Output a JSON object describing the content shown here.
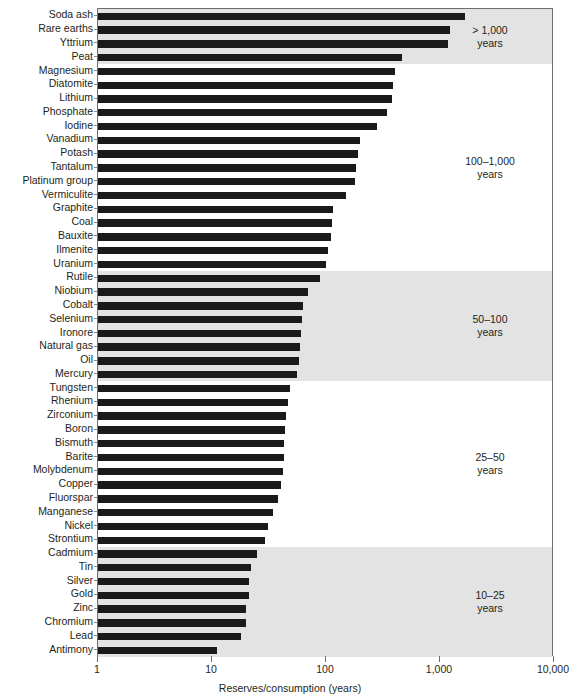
{
  "chart_data": {
    "type": "bar",
    "orientation": "horizontal",
    "title": "",
    "xlabel": "Reserves/consumption (years)",
    "ylabel": "",
    "xscale": "log",
    "xlim": [
      1,
      10000
    ],
    "xticks": [
      1,
      10,
      100,
      1000,
      10000
    ],
    "xtick_labels": [
      "1",
      "10",
      "100",
      "1,000",
      "10,000"
    ],
    "grid": false,
    "legend": false,
    "bar_color": "#1a1a1a",
    "band_shade_color": "#e3e3e3",
    "categories": [
      "Soda ash",
      "Rare earths",
      "Yttrium",
      "Peat",
      "Magnesium",
      "Diatomite",
      "Lithium",
      "Phosphate",
      "Iodine",
      "Vanadium",
      "Potash",
      "Tantalum",
      "Platinum group",
      "Vermiculite",
      "Graphite",
      "Coal",
      "Bauxite",
      "Ilmenite",
      "Uranium",
      "Rutile",
      "Niobium",
      "Cobalt",
      "Selenium",
      "Ironore",
      "Natural gas",
      "Oil",
      "Mercury",
      "Tungsten",
      "Rhenium",
      "Zirconium",
      "Boron",
      "Bismuth",
      "Barite",
      "Molybdenum",
      "Copper",
      "Fluorspar",
      "Manganese",
      "Nickel",
      "Strontium",
      "Cadmium",
      "Tin",
      "Silver",
      "Gold",
      "Zinc",
      "Chromium",
      "Lead",
      "Antimony"
    ],
    "values": [
      1650,
      1230,
      1180,
      460,
      400,
      390,
      380,
      340,
      280,
      200,
      190,
      185,
      180,
      150,
      115,
      112,
      110,
      105,
      100,
      88,
      70,
      63,
      62,
      60,
      59,
      58,
      56,
      48,
      46,
      45,
      44,
      43,
      43,
      42,
      40,
      38,
      34,
      31,
      29,
      25,
      22,
      21,
      21,
      20,
      20,
      18,
      11
    ],
    "groups": [
      {
        "label": "> 1,000\nyears",
        "start": 0,
        "end": 3,
        "shaded": true
      },
      {
        "label": "100–1,000\nyears",
        "start": 4,
        "end": 18,
        "shaded": false
      },
      {
        "label": "50–100\nyears",
        "start": 19,
        "end": 26,
        "shaded": true
      },
      {
        "label": "25–50\nyears",
        "start": 27,
        "end": 38,
        "shaded": false
      },
      {
        "label": "10–25\nyears",
        "start": 39,
        "end": 46,
        "shaded": true
      }
    ]
  }
}
